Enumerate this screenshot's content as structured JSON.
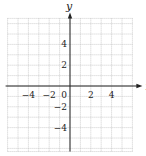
{
  "chart_data": {
    "type": "scatter",
    "title": "",
    "xlabel": "x",
    "ylabel": "y",
    "xlim": [
      -6,
      6
    ],
    "ylim": [
      -6.3,
      6.5
    ],
    "grid": true,
    "x_ticks": [
      -4,
      -2,
      0,
      2,
      4
    ],
    "y_ticks": [
      4,
      2,
      -2,
      -4
    ],
    "x_tick_labels": [
      "−4",
      "−2",
      "0",
      "2",
      "4"
    ],
    "y_tick_labels": [
      "4",
      "2",
      "−2",
      "−4"
    ],
    "series": [],
    "colors": {
      "axis": "#222222",
      "grid": "#b8b8b8",
      "background": "#ffffff"
    }
  }
}
